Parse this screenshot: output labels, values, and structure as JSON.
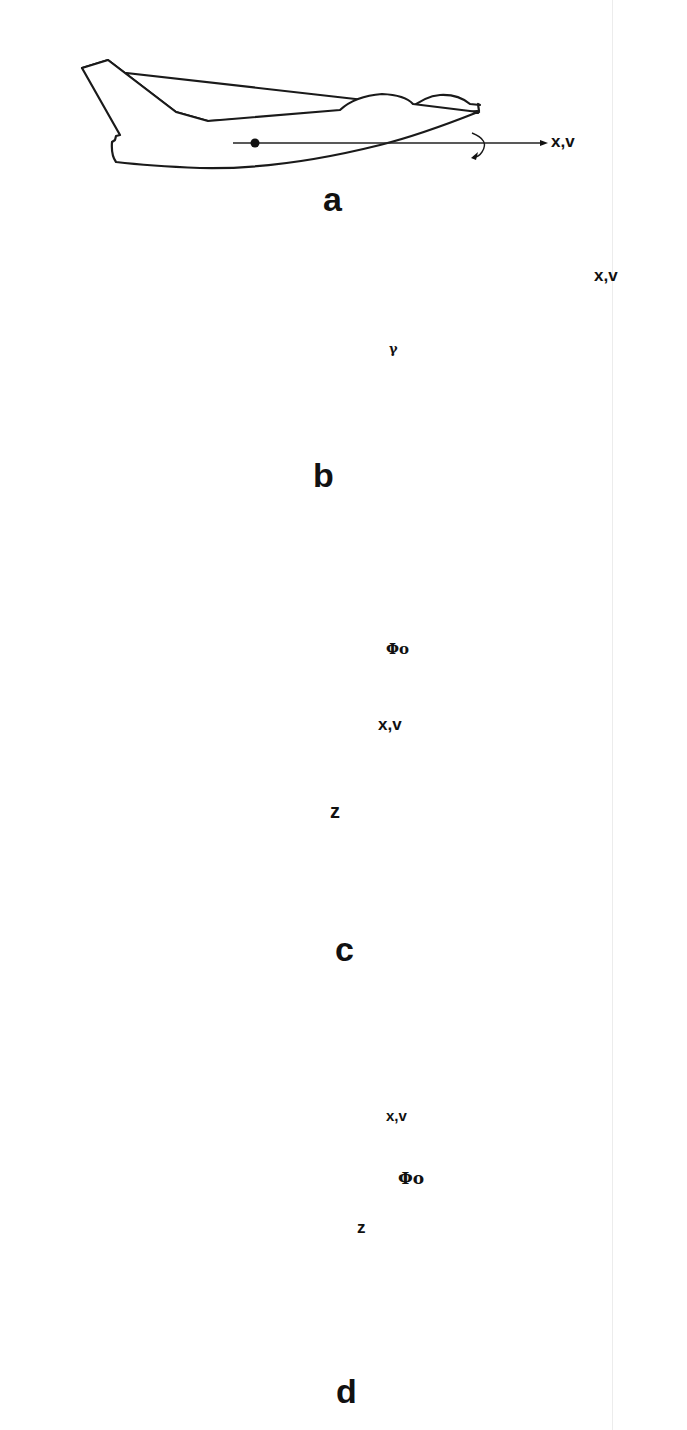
{
  "figure": {
    "panels": [
      {
        "id": "a",
        "label": "a",
        "description": "Aircraft side view, level flight, x-axis along velocity",
        "axis_label": "x,v",
        "rotation_indicator": "roll-arrow"
      },
      {
        "id": "b",
        "label": "b",
        "description": "Aircraft side view climbing at flight path angle",
        "axis_label": "x,v",
        "angle_label": "γ",
        "rotation_indicator": "roll-arrow"
      },
      {
        "id": "c",
        "label": "c",
        "description": "Rear view of aircraft banked, roll angle shown",
        "axis_labels": [
          "x,v",
          "z"
        ],
        "angle_label": "Φo"
      },
      {
        "id": "d",
        "label": "d",
        "description": "Rear view of aircraft banked opposite direction, roll angle shown",
        "axis_labels": [
          "x,v",
          "z"
        ],
        "angle_label": "Φo"
      }
    ],
    "colors": {
      "line": "#1a1a1a",
      "shade": "#b8b8b8",
      "background": "#ffffff"
    }
  }
}
